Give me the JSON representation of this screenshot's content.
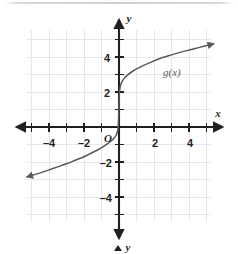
{
  "figure": {
    "kind": "coordinate-grid-graph",
    "background_color": "#ffffff",
    "grid_color": "#e3e3ea",
    "axis_color": "#231f20",
    "curve_color": "#58595b",
    "label_color": "#231f20"
  },
  "axes": {
    "x_axis_name": "x",
    "y_axis_name": "y",
    "origin_label": "O",
    "bottom_marker_label": "y",
    "x_tick_labels": [
      "–4",
      "–2",
      "2",
      "4"
    ],
    "y_tick_labels": [
      "4",
      "2",
      "–2",
      "–4"
    ],
    "x_range": [
      -5.3,
      5.5
    ],
    "y_range": [
      -5.6,
      5.7
    ],
    "minor_tick_step": 0.5,
    "grid_step": 1
  },
  "chart_data": {
    "type": "line",
    "title": "",
    "xlabel": "x",
    "ylabel": "y",
    "grid": true,
    "legend": "inline-label",
    "xlim": [
      -5.3,
      5.5
    ],
    "ylim": [
      -5.6,
      5.7
    ],
    "xticks": [
      -4,
      -2,
      2,
      4
    ],
    "yticks": [
      4,
      2,
      -2,
      -4
    ],
    "series": [
      {
        "name": "g(x)",
        "label": "g(x)",
        "label_x": 2.55,
        "label_y": 3.3,
        "color": "#58595b",
        "arrow_start": true,
        "arrow_end": true,
        "points": [
          [
            -5.25,
            -2.85
          ],
          [
            -5.0,
            -2.78
          ],
          [
            -4.5,
            -2.62
          ],
          [
            -4.0,
            -2.45
          ],
          [
            -3.5,
            -2.28
          ],
          [
            -3.0,
            -2.1
          ],
          [
            -2.5,
            -1.9
          ],
          [
            -2.0,
            -1.7
          ],
          [
            -1.6,
            -1.5
          ],
          [
            -1.2,
            -1.3
          ],
          [
            -0.9,
            -1.12
          ],
          [
            -0.65,
            -0.95
          ],
          [
            -0.45,
            -0.8
          ],
          [
            -0.3,
            -0.65
          ],
          [
            -0.18,
            -0.5
          ],
          [
            -0.1,
            -0.3
          ],
          [
            -0.05,
            -0.05
          ],
          [
            -0.02,
            0.6
          ],
          [
            0.0,
            1.45
          ],
          [
            0.02,
            1.95
          ],
          [
            0.07,
            2.3
          ],
          [
            0.15,
            2.55
          ],
          [
            0.3,
            2.78
          ],
          [
            0.5,
            2.98
          ],
          [
            0.8,
            3.2
          ],
          [
            1.2,
            3.42
          ],
          [
            1.7,
            3.65
          ],
          [
            2.3,
            3.9
          ],
          [
            3.0,
            4.12
          ],
          [
            3.8,
            4.35
          ],
          [
            4.6,
            4.55
          ],
          [
            5.4,
            4.75
          ]
        ]
      }
    ]
  }
}
